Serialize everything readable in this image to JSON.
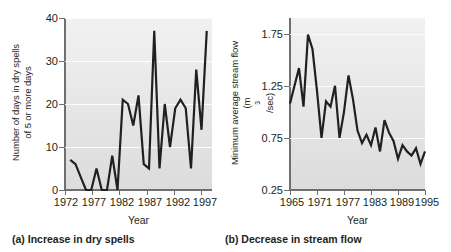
{
  "figure": {
    "panels": [
      {
        "key": "a",
        "caption": "(a) Increase in dry spells",
        "xlabel": "Year",
        "ylabel_line1": "Number of days in dry spells",
        "ylabel_line2": "of 5 or more days",
        "xticks": [
          "1972",
          "1977",
          "1982",
          "1987",
          "1992",
          "1997"
        ],
        "yticks": [
          "0",
          "10",
          "20",
          "30",
          "40"
        ]
      },
      {
        "key": "b",
        "caption": "(b) Decrease in stream flow",
        "xlabel": "Year",
        "ylabel_line1": "Minimum average stream flow",
        "ylabel_line2": "(m3/sec)",
        "xticks": [
          "1965",
          "1971",
          "1977",
          "1983",
          "1989",
          "1995"
        ],
        "yticks": [
          "0.25",
          "0.75",
          "1.25",
          "1.75"
        ]
      }
    ],
    "line_color": "#231f20",
    "plot_bg_top": "#f1f1f1",
    "plot_bg_bottom": "#dcdcdc",
    "gridline_color": "#fdfdfd",
    "axis_color": "#6f6f6f"
  },
  "chart_data": [
    {
      "type": "line",
      "panel": "a",
      "title": "(a) Increase in dry spells",
      "xlabel": "Year",
      "ylabel": "Number of days in dry spells of 5 or more days",
      "xlim": [
        1971,
        1999
      ],
      "ylim": [
        0,
        40
      ],
      "yticks": [
        0,
        10,
        20,
        30,
        40
      ],
      "xticks": [
        1972,
        1977,
        1982,
        1987,
        1992,
        1997
      ],
      "grid": "horizontal",
      "legend": "none",
      "x": [
        1972,
        1973,
        1974,
        1975,
        1976,
        1977,
        1978,
        1979,
        1980,
        1981,
        1982,
        1983,
        1984,
        1985,
        1986,
        1987,
        1988,
        1989,
        1990,
        1991,
        1992,
        1993,
        1994,
        1995,
        1996,
        1997,
        1998
      ],
      "values": [
        7,
        6,
        3,
        0,
        0,
        5,
        0,
        0,
        8,
        0,
        21,
        20,
        15,
        22,
        6,
        5,
        37,
        5,
        20,
        10,
        19,
        21,
        19,
        5,
        28,
        14,
        37
      ]
    },
    {
      "type": "line",
      "panel": "b",
      "title": "(b) Decrease in stream flow",
      "xlabel": "Year",
      "ylabel": "Minimum average stream flow (m3/sec)",
      "xlim": [
        1965,
        1995
      ],
      "ylim": [
        0.25,
        1.9
      ],
      "yticks": [
        0.25,
        0.75,
        1.25,
        1.75
      ],
      "xticks": [
        1965,
        1971,
        1977,
        1983,
        1989,
        1995
      ],
      "grid": "horizontal",
      "legend": "none",
      "x": [
        1965,
        1966,
        1967,
        1968,
        1969,
        1970,
        1971,
        1972,
        1973,
        1974,
        1975,
        1976,
        1977,
        1978,
        1979,
        1980,
        1981,
        1982,
        1983,
        1984,
        1985,
        1986,
        1987,
        1988,
        1989,
        1990,
        1991,
        1992,
        1993,
        1994,
        1995
      ],
      "values": [
        1.08,
        1.25,
        1.42,
        1.05,
        1.74,
        1.6,
        1.2,
        0.75,
        1.1,
        1.05,
        1.25,
        0.75,
        1.0,
        1.35,
        1.12,
        0.82,
        0.7,
        0.78,
        0.68,
        0.85,
        0.62,
        0.92,
        0.8,
        0.72,
        0.55,
        0.68,
        0.62,
        0.58,
        0.65,
        0.5,
        0.62
      ]
    }
  ]
}
